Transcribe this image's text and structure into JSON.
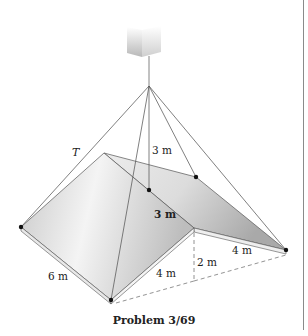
{
  "figure": {
    "caption": "Problem 3/69",
    "labels": {
      "tension": "T",
      "cable_height": "3 m",
      "ridge_width": "3 m",
      "left_edge": "6 m",
      "front_edge": "4 m",
      "wall_height": "2 m",
      "right_edge": "4 m"
    },
    "colors": {
      "line": "#555555",
      "dot": "#111111",
      "slab_light": "#f2f2f2",
      "slab_dark": "#b9b9b9",
      "dashed": "#777777"
    }
  }
}
